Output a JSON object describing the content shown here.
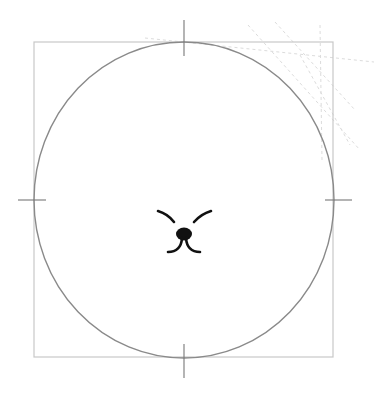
{
  "canvas": {
    "width": 374,
    "height": 399,
    "background": "#ffffff"
  },
  "frame": {
    "x": 34,
    "y": 42,
    "width": 299,
    "height": 315,
    "stroke": "#c8c8c8"
  },
  "circle": {
    "cx": 184,
    "cy": 200,
    "rx": 150,
    "ry": 158,
    "stroke": "#8a8a8a"
  },
  "crosshair_ticks": {
    "stroke": "#777777",
    "top": {
      "x1": 184,
      "y1": 20,
      "x2": 184,
      "y2": 56
    },
    "bottom": {
      "x1": 184,
      "y1": 344,
      "x2": 184,
      "y2": 378
    },
    "left": {
      "x1": 18,
      "y1": 200,
      "x2": 46,
      "y2": 200
    },
    "right": {
      "x1": 325,
      "y1": 200,
      "x2": 352,
      "y2": 200
    }
  },
  "face": {
    "color": "#111111",
    "icon": "cat-face-icon"
  },
  "guides": {
    "color": "#d9d9d9"
  }
}
